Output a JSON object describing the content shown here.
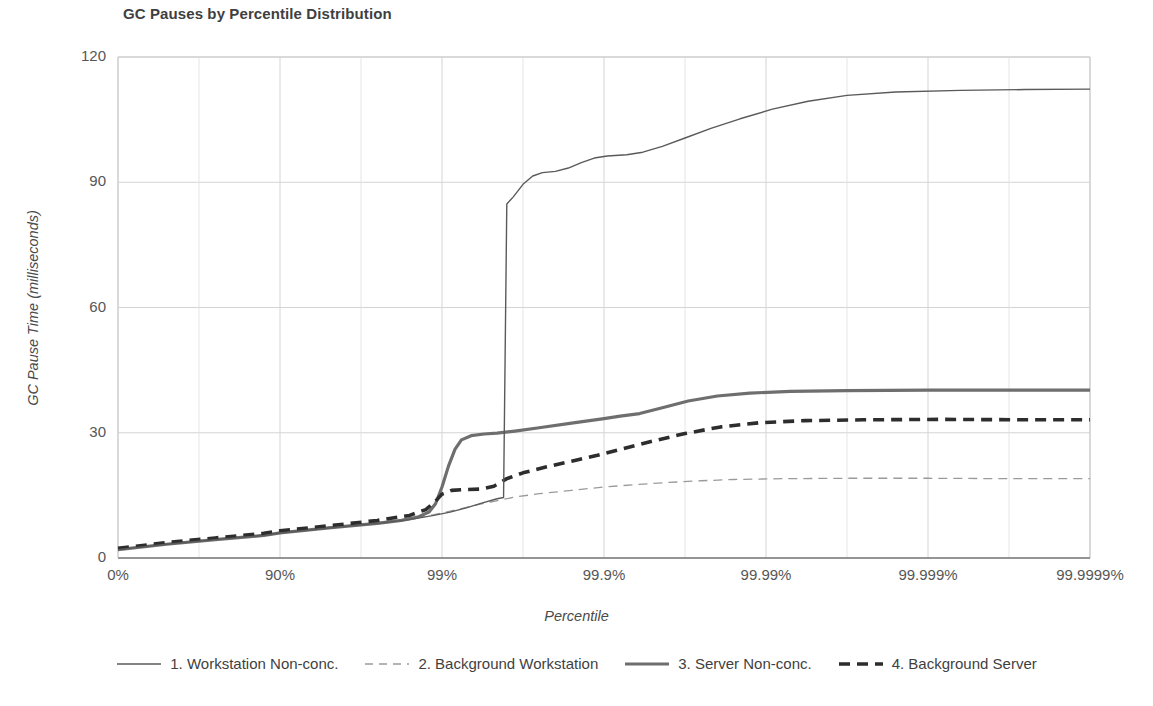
{
  "chart_data": {
    "type": "line",
    "title": "GC Pauses by Percentile Distribution",
    "xlabel": "Percentile",
    "ylabel": "GC Pause Time (milliseconds)",
    "ylim": [
      0,
      120
    ],
    "yticks": [
      0,
      30,
      60,
      90,
      120
    ],
    "ytick_labels": [
      "0",
      "30",
      "60",
      "90",
      "120"
    ],
    "xtick_labels": [
      "0%",
      "90%",
      "99%",
      "99.9%",
      "99.99%",
      "99.999%",
      "99.9999%"
    ],
    "xtick_positions": [
      0,
      1,
      2,
      3,
      4,
      5,
      6
    ],
    "xlim": [
      0,
      6
    ],
    "grid": true,
    "legend_position": "bottom",
    "x_axis_note": "logarithmic survival scale; each unit is one additional nine",
    "series": [
      {
        "name": "1. Workstation Non-conc.",
        "style": "solid",
        "width": 1.4,
        "color": "#5a5a5a",
        "points": [
          [
            0.0,
            2.0
          ],
          [
            0.3,
            3.3
          ],
          [
            0.6,
            4.4
          ],
          [
            0.9,
            5.4
          ],
          [
            1.0,
            6.0
          ],
          [
            1.3,
            7.2
          ],
          [
            1.6,
            8.3
          ],
          [
            1.8,
            9.2
          ],
          [
            1.95,
            10.2
          ],
          [
            2.05,
            11.0
          ],
          [
            2.15,
            12.0
          ],
          [
            2.25,
            13.2
          ],
          [
            2.34,
            14.2
          ],
          [
            2.38,
            14.5
          ],
          [
            2.4,
            84.8
          ],
          [
            2.44,
            86.5
          ],
          [
            2.5,
            89.5
          ],
          [
            2.56,
            91.5
          ],
          [
            2.62,
            92.3
          ],
          [
            2.7,
            92.6
          ],
          [
            2.78,
            93.4
          ],
          [
            2.86,
            94.7
          ],
          [
            2.94,
            95.8
          ],
          [
            3.02,
            96.3
          ],
          [
            3.14,
            96.6
          ],
          [
            3.24,
            97.2
          ],
          [
            3.36,
            98.6
          ],
          [
            3.5,
            100.6
          ],
          [
            3.66,
            102.9
          ],
          [
            3.84,
            105.2
          ],
          [
            4.04,
            107.5
          ],
          [
            4.26,
            109.4
          ],
          [
            4.5,
            110.8
          ],
          [
            4.8,
            111.6
          ],
          [
            5.2,
            112.0
          ],
          [
            5.6,
            112.2
          ],
          [
            6.0,
            112.3
          ]
        ]
      },
      {
        "name": "2. Background Workstation",
        "style": "dashed",
        "width": 1.3,
        "color": "#9a9a9a",
        "points": [
          [
            0.0,
            2.1
          ],
          [
            0.3,
            3.4
          ],
          [
            0.6,
            4.5
          ],
          [
            0.9,
            5.5
          ],
          [
            1.0,
            6.1
          ],
          [
            1.3,
            7.3
          ],
          [
            1.6,
            8.4
          ],
          [
            1.8,
            9.4
          ],
          [
            1.95,
            10.4
          ],
          [
            2.05,
            11.2
          ],
          [
            2.15,
            12.1
          ],
          [
            2.25,
            13.0
          ],
          [
            2.35,
            13.8
          ],
          [
            2.45,
            14.6
          ],
          [
            2.6,
            15.4
          ],
          [
            2.8,
            16.2
          ],
          [
            3.0,
            17.0
          ],
          [
            3.2,
            17.6
          ],
          [
            3.4,
            18.1
          ],
          [
            3.6,
            18.5
          ],
          [
            3.8,
            18.8
          ],
          [
            4.1,
            19.0
          ],
          [
            4.5,
            19.1
          ],
          [
            5.0,
            19.1
          ],
          [
            5.5,
            19.0
          ],
          [
            6.0,
            19.0
          ]
        ]
      },
      {
        "name": "3. Server Non-conc.",
        "style": "solid",
        "width": 3.2,
        "color": "#6e6e6e",
        "points": [
          [
            0.0,
            2.0
          ],
          [
            0.3,
            3.3
          ],
          [
            0.6,
            4.4
          ],
          [
            0.9,
            5.4
          ],
          [
            1.0,
            6.0
          ],
          [
            1.3,
            7.2
          ],
          [
            1.6,
            8.3
          ],
          [
            1.75,
            9.0
          ],
          [
            1.85,
            9.8
          ],
          [
            1.92,
            11.0
          ],
          [
            1.96,
            13.0
          ],
          [
            2.0,
            17.0
          ],
          [
            2.04,
            22.0
          ],
          [
            2.08,
            26.0
          ],
          [
            2.12,
            28.3
          ],
          [
            2.18,
            29.3
          ],
          [
            2.26,
            29.7
          ],
          [
            2.34,
            29.9
          ],
          [
            2.45,
            30.4
          ],
          [
            2.6,
            31.2
          ],
          [
            2.8,
            32.3
          ],
          [
            3.0,
            33.4
          ],
          [
            3.1,
            34.0
          ],
          [
            3.22,
            34.6
          ],
          [
            3.36,
            36.0
          ],
          [
            3.52,
            37.6
          ],
          [
            3.7,
            38.8
          ],
          [
            3.9,
            39.5
          ],
          [
            4.15,
            39.9
          ],
          [
            4.5,
            40.1
          ],
          [
            5.0,
            40.2
          ],
          [
            5.5,
            40.2
          ],
          [
            6.0,
            40.2
          ]
        ]
      },
      {
        "name": "4. Background Server",
        "style": "dashed",
        "width": 3.6,
        "color": "#2d2d2d",
        "points": [
          [
            0.0,
            2.3
          ],
          [
            0.3,
            3.7
          ],
          [
            0.6,
            4.8
          ],
          [
            0.9,
            5.9
          ],
          [
            1.0,
            6.5
          ],
          [
            1.3,
            7.7
          ],
          [
            1.6,
            9.0
          ],
          [
            1.8,
            10.2
          ],
          [
            1.9,
            11.6
          ],
          [
            1.96,
            13.6
          ],
          [
            2.0,
            15.3
          ],
          [
            2.06,
            16.2
          ],
          [
            2.14,
            16.4
          ],
          [
            2.24,
            16.5
          ],
          [
            2.32,
            17.2
          ],
          [
            2.4,
            19.0
          ],
          [
            2.5,
            20.4
          ],
          [
            2.64,
            21.8
          ],
          [
            2.8,
            23.2
          ],
          [
            2.96,
            24.6
          ],
          [
            3.12,
            26.2
          ],
          [
            3.3,
            28.0
          ],
          [
            3.5,
            29.8
          ],
          [
            3.72,
            31.4
          ],
          [
            3.96,
            32.4
          ],
          [
            4.24,
            32.9
          ],
          [
            4.6,
            33.1
          ],
          [
            5.1,
            33.2
          ],
          [
            5.6,
            33.1
          ],
          [
            6.0,
            33.1
          ]
        ]
      }
    ]
  },
  "colors": {
    "grid": "#d4d4d4",
    "axis": "#6a6a6a",
    "text": "#4a4a4a",
    "background": "#ffffff"
  }
}
